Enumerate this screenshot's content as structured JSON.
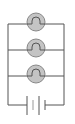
{
  "diagram": {
    "type": "parallel-circuit",
    "bulb_count": 3,
    "colors": {
      "wire": "#555555",
      "bulb_fill": "#bdbdbd",
      "bulb_stroke": "#777777",
      "background": "#ffffff"
    }
  }
}
